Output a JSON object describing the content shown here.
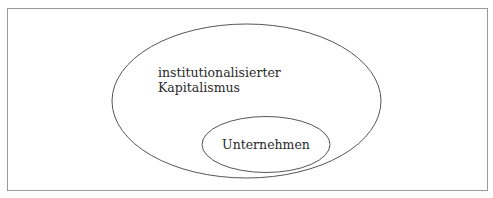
{
  "diagram": {
    "type": "nested-sets",
    "colors": {
      "stroke": "#555555",
      "border": "#9a9a9a",
      "text": "#2a2a2a",
      "background": "#ffffff"
    },
    "outer_set": {
      "label_line1": "institutionalisierter",
      "label_line2": "Kapitalismus"
    },
    "inner_set": {
      "label": "Unternehmen"
    }
  }
}
